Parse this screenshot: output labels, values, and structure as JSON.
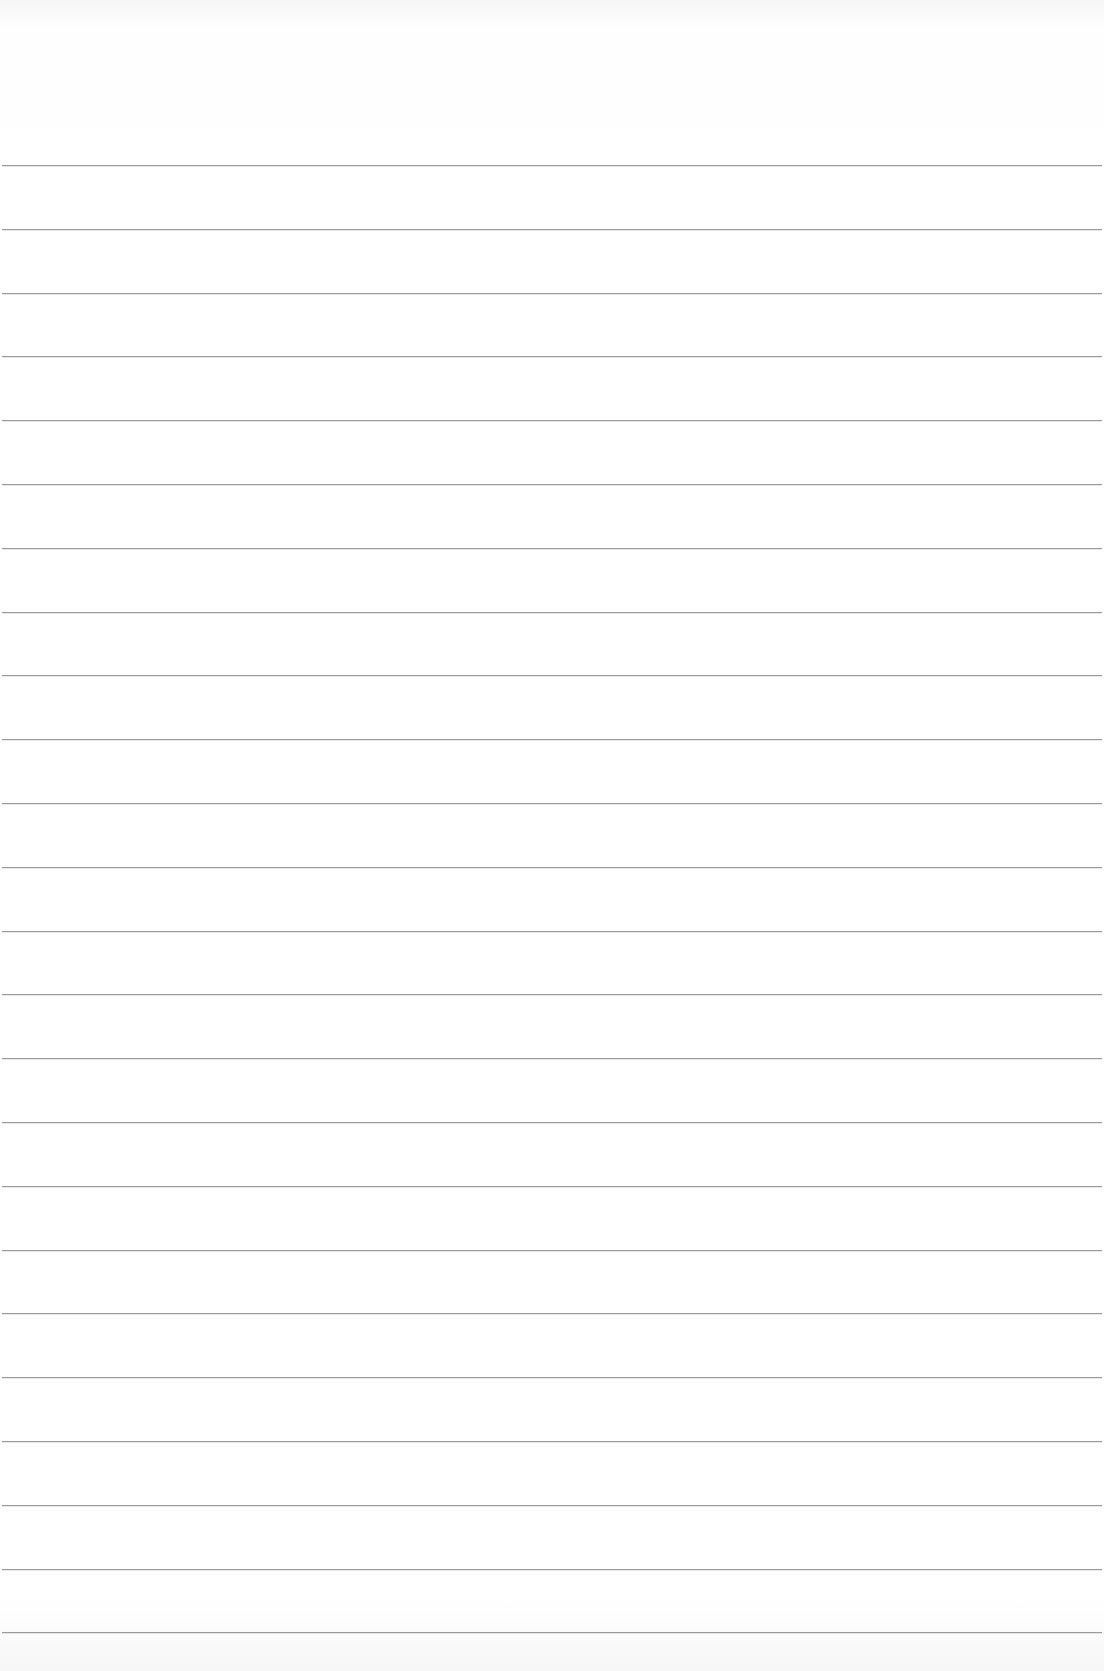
{
  "page": {
    "type": "blank lined paper",
    "text_content": "",
    "background_color": "#ffffff",
    "rule_color": "#8a8a8a",
    "rules": {
      "count": 24,
      "first_y": 165,
      "last_y": 1633,
      "spacing_px": 63.8
    }
  }
}
